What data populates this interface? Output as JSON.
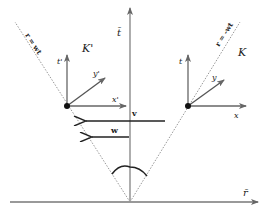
{
  "diagram": {
    "axes": {
      "time_axis_label": "t̄",
      "space_axis_label": "r̄"
    },
    "light_lines": {
      "left_label": "r = wt",
      "right_label": "r = -wt"
    },
    "frames": {
      "moving": {
        "name": "K'",
        "t_label": "t'",
        "x_label": "x'",
        "y_label": "y'"
      },
      "rest": {
        "name": "K",
        "t_label": "t",
        "x_label": "x",
        "y_label": "y"
      }
    },
    "velocities": {
      "v_label": "v",
      "w_label": "w"
    },
    "colors": {
      "axis": "#777777",
      "arrow": "#222222",
      "dotted": "#999999",
      "point": "#111111"
    }
  }
}
